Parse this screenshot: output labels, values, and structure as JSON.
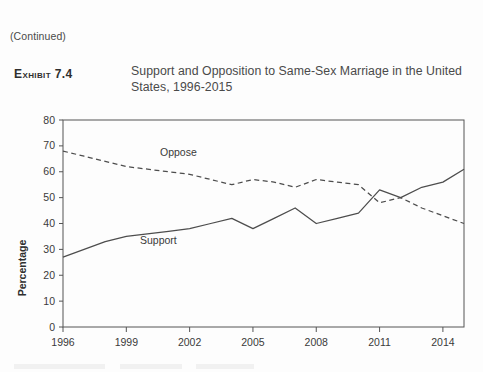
{
  "page": {
    "continued_note": "(Continued)"
  },
  "exhibit": {
    "label": "Exhibit 7.4",
    "title": "Support and Opposition to Same-Sex Marriage in the United States, 1996-2015"
  },
  "chart_data": {
    "type": "line",
    "title": "Support and Opposition to Same-Sex Marriage in the United States, 1996-2015",
    "xlabel": "",
    "ylabel": "Percentage",
    "xlim": [
      1996,
      2015
    ],
    "ylim": [
      0,
      80
    ],
    "ytick_labels": [
      "0",
      "10",
      "20",
      "30",
      "40",
      "50",
      "60",
      "70",
      "80"
    ],
    "yticks": [
      0,
      10,
      20,
      30,
      40,
      50,
      60,
      70,
      80
    ],
    "xtick_labels": [
      "1996",
      "1999",
      "2002",
      "2005",
      "2008",
      "2011",
      "2014"
    ],
    "xticks": [
      1996,
      1999,
      2002,
      2005,
      2008,
      2011,
      2014
    ],
    "grid": false,
    "legend": "inline-labels",
    "x": [
      1996,
      1997,
      1998,
      1999,
      2000,
      2001,
      2002,
      2003,
      2004,
      2005,
      2006,
      2007,
      2008,
      2009,
      2010,
      2011,
      2012,
      2013,
      2014,
      2015
    ],
    "series": [
      {
        "name": "Support",
        "style": "solid",
        "label": "Support",
        "values": [
          27,
          30,
          33,
          35,
          36,
          37,
          38,
          40,
          42,
          38,
          42,
          46,
          40,
          42,
          44,
          53,
          50,
          54,
          56,
          61
        ]
      },
      {
        "name": "Oppose",
        "style": "dashed",
        "label": "Oppose",
        "values": [
          68,
          66,
          64,
          62,
          61,
          60,
          59,
          57,
          55,
          57,
          56,
          54,
          57,
          56,
          55,
          48,
          50,
          46,
          43,
          40
        ]
      }
    ]
  },
  "colors": {
    "line": "#4d4d4d",
    "axis": "#555555",
    "text": "#3a3a3a",
    "background": "#fdfdfd"
  }
}
